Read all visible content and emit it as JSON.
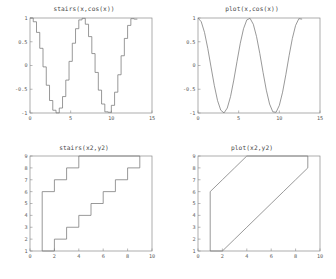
{
  "figure": {
    "background": "#ffffff",
    "line_color": "#777777",
    "axis_color": "#8a8a8a",
    "text_color": "#555555"
  },
  "panels": [
    {
      "key": "tl",
      "title": "stairs(x,cos(x))"
    },
    {
      "key": "tr",
      "title": "plot(x,cos(x))"
    },
    {
      "key": "bl",
      "title": "stairs(x2,y2)"
    },
    {
      "key": "br",
      "title": "plot(x2,y2)"
    }
  ],
  "chart_data": [
    {
      "id": "stairs-x-cos-x",
      "type": "line",
      "title": "stairs(x,cos(x))",
      "style": "step",
      "xlabel": "",
      "ylabel": "",
      "xlim": [
        0,
        15
      ],
      "ylim": [
        -1,
        1
      ],
      "grid": false,
      "legend": false,
      "xticks": [
        0,
        5,
        10,
        15
      ],
      "xticklabels": [
        "0",
        "5",
        "10",
        "15"
      ],
      "yticks": [
        -1,
        -0.5,
        0,
        0.5,
        1
      ],
      "yticklabels": [
        "-1",
        "-0.5",
        "0",
        "0.5",
        "1"
      ],
      "x": [
        0,
        0.4,
        0.8,
        1.2,
        1.6,
        2,
        2.4,
        2.8,
        3.2,
        3.6,
        4,
        4.4,
        4.8,
        5.2,
        5.6,
        6,
        6.4,
        6.8,
        7.2,
        7.6,
        8,
        8.4,
        8.8,
        9.2,
        9.6,
        10,
        10.4,
        10.8,
        11.2,
        11.6,
        12,
        12.4,
        12.8,
        13.2
      ],
      "y": [
        1,
        0.921,
        0.697,
        0.362,
        -0.029,
        -0.416,
        -0.737,
        -0.942,
        -0.998,
        -0.896,
        -0.654,
        -0.307,
        0.087,
        0.469,
        0.775,
        0.96,
        0.993,
        0.869,
        0.608,
        0.251,
        -0.146,
        -0.519,
        -0.811,
        -0.975,
        -0.985,
        -0.839,
        -0.562,
        -0.195,
        0.205,
        0.57,
        0.844,
        0.986,
        0.976
      ]
    },
    {
      "id": "plot-x-cos-x",
      "type": "line",
      "title": "plot(x,cos(x))",
      "style": "linear",
      "xlabel": "",
      "ylabel": "",
      "xlim": [
        0,
        15
      ],
      "ylim": [
        -1,
        1
      ],
      "grid": false,
      "legend": false,
      "xticks": [
        0,
        5,
        10,
        15
      ],
      "xticklabels": [
        "0",
        "5",
        "10",
        "15"
      ],
      "yticks": [
        -1,
        -0.5,
        0,
        0.5,
        1
      ],
      "yticklabels": [
        "-1",
        "-0.5",
        "0",
        "0.5",
        "1"
      ],
      "x": [
        0,
        0.4,
        0.8,
        1.2,
        1.6,
        2,
        2.4,
        2.8,
        3.2,
        3.6,
        4,
        4.4,
        4.8,
        5.2,
        5.6,
        6,
        6.4,
        6.8,
        7.2,
        7.6,
        8,
        8.4,
        8.8,
        9.2,
        9.6,
        10,
        10.4,
        10.8,
        11.2,
        11.6,
        12,
        12.4,
        12.8,
        13.2
      ],
      "y": [
        1,
        0.921,
        0.697,
        0.362,
        -0.029,
        -0.416,
        -0.737,
        -0.942,
        -0.998,
        -0.896,
        -0.654,
        -0.307,
        0.087,
        0.469,
        0.775,
        0.96,
        0.993,
        0.869,
        0.608,
        0.251,
        -0.146,
        -0.519,
        -0.811,
        -0.975,
        -0.985,
        -0.839,
        -0.562,
        -0.195,
        0.205,
        0.57,
        0.844,
        0.986,
        0.976
      ]
    },
    {
      "id": "stairs-x2-y2",
      "type": "line",
      "title": "stairs(x2,y2)",
      "style": "step",
      "xlabel": "",
      "ylabel": "",
      "xlim": [
        0,
        10
      ],
      "ylim": [
        1,
        9
      ],
      "grid": false,
      "legend": false,
      "xticks": [
        0,
        2,
        4,
        6,
        8,
        10
      ],
      "xticklabels": [
        "0",
        "2",
        "4",
        "6",
        "8",
        "10"
      ],
      "yticks": [
        1,
        2,
        3,
        4,
        5,
        6,
        7,
        8,
        9
      ],
      "yticklabels": [
        "1",
        "2",
        "3",
        "4",
        "5",
        "6",
        "7",
        "8",
        "9"
      ],
      "x2": [
        1,
        1,
        2,
        3,
        4,
        9,
        9,
        8,
        7,
        6,
        5,
        4,
        3,
        2,
        1
      ],
      "y2": [
        1,
        6,
        7,
        8,
        9,
        9,
        8,
        7,
        6,
        5,
        4,
        3,
        2,
        1,
        1
      ]
    },
    {
      "id": "plot-x2-y2",
      "type": "line",
      "title": "plot(x2,y2)",
      "style": "linear",
      "xlabel": "",
      "ylabel": "",
      "xlim": [
        0,
        10
      ],
      "ylim": [
        1,
        9
      ],
      "grid": false,
      "legend": false,
      "xticks": [
        0,
        2,
        4,
        6,
        8,
        10
      ],
      "xticklabels": [
        "0",
        "2",
        "4",
        "6",
        "8",
        "10"
      ],
      "yticks": [
        1,
        2,
        3,
        4,
        5,
        6,
        7,
        8,
        9
      ],
      "yticklabels": [
        "1",
        "2",
        "3",
        "4",
        "5",
        "6",
        "7",
        "8",
        "9"
      ],
      "x2": [
        1,
        1,
        2,
        3,
        4,
        9,
        9,
        8,
        7,
        6,
        5,
        4,
        3,
        2,
        1
      ],
      "y2": [
        1,
        6,
        7,
        8,
        9,
        9,
        8,
        7,
        6,
        5,
        4,
        3,
        2,
        1,
        1
      ]
    }
  ]
}
